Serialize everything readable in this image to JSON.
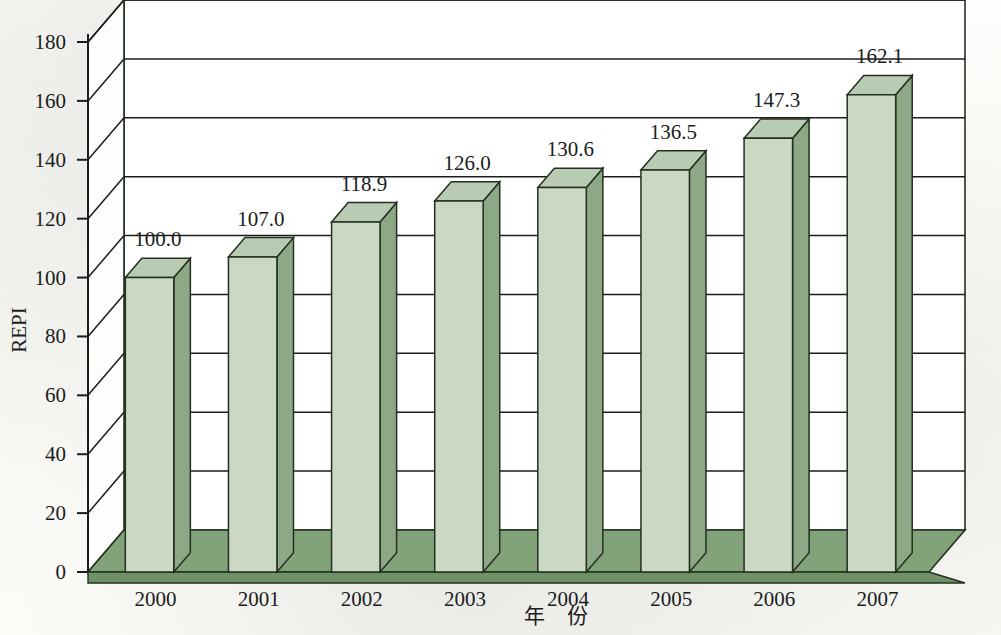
{
  "chart_data": {
    "type": "bar",
    "title": "",
    "subtitle": "",
    "xlabel": "年 份",
    "ylabel": "REPI",
    "categories": [
      "2000",
      "2001",
      "2002",
      "2003",
      "2004",
      "2005",
      "2006",
      "2007"
    ],
    "values": [
      100.0,
      107.0,
      118.9,
      126.0,
      130.6,
      136.5,
      147.3,
      162.1
    ],
    "value_labels": [
      "100.0",
      "107.0",
      "118.9",
      "126.0",
      "130.6",
      "136.5",
      "147.3",
      "162.1"
    ],
    "series": [
      {
        "name": "REPI",
        "values": [
          100.0,
          107.0,
          118.9,
          126.0,
          130.6,
          136.5,
          147.3,
          162.1
        ]
      }
    ],
    "ylim": [
      0,
      180
    ],
    "ytick_step": 20,
    "ytick_labels": [
      "0",
      "20",
      "40",
      "60",
      "80",
      "100",
      "120",
      "140",
      "160",
      "180"
    ],
    "ytick_values": [
      0,
      20,
      40,
      60,
      80,
      100,
      120,
      140,
      160,
      180
    ],
    "grid": true,
    "grid_axis": "y",
    "legend": false,
    "legend_position": "none",
    "projection": "3d-isometric",
    "bar_style": "3d-column",
    "colors": {
      "bar_front": "#cbd8c4",
      "bar_side": "#8ca886",
      "bar_top": "#b9cbb2",
      "floor": "#82a37a",
      "floor_front": "#6f9167",
      "outline": "#23301f",
      "axis": "#1c1c1c",
      "grid": "#1c1c1c",
      "text": "#1c1c1c",
      "background": "#fbfbf8"
    }
  },
  "axes": {
    "y_title": "REPI",
    "x_title": "年 份"
  }
}
